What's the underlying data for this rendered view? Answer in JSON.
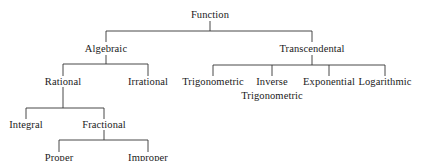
{
  "diagram": {
    "type": "tree",
    "line_color": "#333333",
    "nodes": {
      "function": "Function",
      "algebraic": "Algebraic",
      "transcendental": "Transcendental",
      "rational": "Rational",
      "irrational": "Irrational",
      "trigonometric": "Trigonometric",
      "inverse_trig_line1": "Inverse",
      "inverse_trig_line2": "Trigonometric",
      "exponential": "Exponential",
      "logarithmic": "Logarithmic",
      "integral": "Integral",
      "fractional": "Fractional",
      "proper": "Proper",
      "improper": "Improper"
    },
    "edges": [
      [
        "Function",
        "Algebraic"
      ],
      [
        "Function",
        "Transcendental"
      ],
      [
        "Algebraic",
        "Rational"
      ],
      [
        "Algebraic",
        "Irrational"
      ],
      [
        "Transcendental",
        "Trigonometric"
      ],
      [
        "Transcendental",
        "Inverse Trigonometric"
      ],
      [
        "Transcendental",
        "Exponential"
      ],
      [
        "Transcendental",
        "Logarithmic"
      ],
      [
        "Rational",
        "Integral"
      ],
      [
        "Rational",
        "Fractional"
      ],
      [
        "Fractional",
        "Proper"
      ],
      [
        "Fractional",
        "Improper"
      ]
    ]
  }
}
